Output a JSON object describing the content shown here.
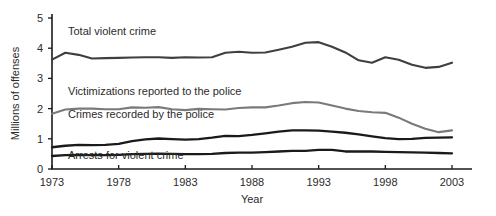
{
  "chart_data": {
    "type": "line",
    "title": "",
    "xlabel": "Year",
    "ylabel": "Millions of offenses",
    "xlim": [
      1973,
      2003
    ],
    "ylim": [
      0,
      5
    ],
    "grid": false,
    "legend_position": "inline-labels",
    "xticks": [
      "1973",
      "1978",
      "1983",
      "1988",
      "1993",
      "1998",
      "2003"
    ],
    "xtick_values": [
      1973,
      1978,
      1983,
      1988,
      1993,
      1998,
      2003
    ],
    "yticks": [
      "0",
      "1",
      "2",
      "3",
      "4",
      "5"
    ],
    "ytick_values": [
      0,
      1,
      2,
      3,
      4,
      5
    ],
    "x": [
      1973,
      1974,
      1975,
      1976,
      1977,
      1978,
      1979,
      1980,
      1981,
      1982,
      1983,
      1984,
      1985,
      1986,
      1987,
      1988,
      1989,
      1990,
      1991,
      1992,
      1993,
      1994,
      1995,
      1996,
      1997,
      1998,
      1999,
      2000,
      2001,
      2002,
      2003
    ],
    "series": [
      {
        "name": "Total violent crime",
        "color": "#3f3f3f",
        "width": 2.1,
        "label_x": 1974.2,
        "label_y": 4.45,
        "values": [
          3.62,
          3.85,
          3.78,
          3.66,
          3.67,
          3.68,
          3.69,
          3.7,
          3.7,
          3.68,
          3.7,
          3.69,
          3.7,
          3.85,
          3.88,
          3.85,
          3.86,
          3.95,
          4.05,
          4.18,
          4.2,
          4.05,
          3.86,
          3.6,
          3.52,
          3.7,
          3.62,
          3.45,
          3.35,
          3.38,
          3.52
        ]
      },
      {
        "name": "Victimizations reported to the police",
        "color": "#7a7a7a",
        "width": 2.1,
        "label_x": 1974.2,
        "label_y": 2.44,
        "values": [
          1.83,
          1.97,
          2.0,
          2.0,
          1.98,
          1.98,
          2.04,
          2.03,
          2.05,
          1.98,
          1.95,
          1.99,
          1.98,
          1.97,
          2.02,
          2.04,
          2.04,
          2.1,
          2.18,
          2.22,
          2.2,
          2.1,
          2.0,
          1.92,
          1.88,
          1.86,
          1.7,
          1.5,
          1.33,
          1.22,
          1.28
        ]
      },
      {
        "name": "Crimes recorded by the police",
        "color": "#1a1a1a",
        "width": 2.3,
        "label_x": 1974.2,
        "label_y": 1.7,
        "values": [
          0.72,
          0.77,
          0.8,
          0.79,
          0.8,
          0.83,
          0.92,
          0.98,
          1.01,
          0.99,
          0.97,
          0.99,
          1.04,
          1.1,
          1.09,
          1.13,
          1.18,
          1.24,
          1.28,
          1.28,
          1.27,
          1.24,
          1.2,
          1.15,
          1.08,
          1.02,
          0.99,
          1.0,
          1.03,
          1.04,
          1.05
        ]
      },
      {
        "name": "Arrests for violent crime",
        "color": "#1a1a1a",
        "width": 2.3,
        "label_x": 1974.2,
        "label_y": 0.33,
        "values": [
          0.43,
          0.46,
          0.47,
          0.46,
          0.46,
          0.47,
          0.49,
          0.5,
          0.51,
          0.5,
          0.49,
          0.49,
          0.5,
          0.53,
          0.54,
          0.54,
          0.56,
          0.58,
          0.6,
          0.6,
          0.63,
          0.63,
          0.58,
          0.58,
          0.58,
          0.57,
          0.56,
          0.55,
          0.54,
          0.53,
          0.52
        ]
      }
    ]
  }
}
